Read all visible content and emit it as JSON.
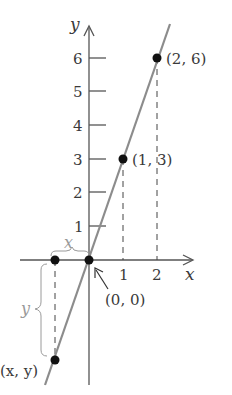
{
  "figure": {
    "type": "line-graph",
    "equation": "y = 3x",
    "axes": {
      "x_label": "x",
      "y_label": "y",
      "x_ticks": [
        "1",
        "2"
      ],
      "y_ticks": [
        "1",
        "2",
        "3",
        "4",
        "5",
        "6"
      ]
    },
    "points": [
      {
        "label": "(2, 6)",
        "x": 2,
        "y": 6
      },
      {
        "label": "(1, 3)",
        "x": 1,
        "y": 3
      },
      {
        "label": "(0, 0)",
        "x": 0,
        "y": 0
      },
      {
        "label": "(x, y)",
        "x": -1,
        "y": -3
      }
    ],
    "brace_labels": {
      "horizontal": "x",
      "vertical": "y"
    },
    "colors": {
      "line": "#8c8c8c",
      "axes": "#555555",
      "points": "#111111",
      "brace": "#9a9a9a"
    }
  }
}
